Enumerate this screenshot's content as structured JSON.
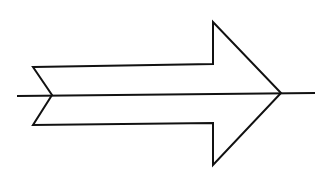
{
  "diagram": {
    "type": "arrow-with-axis",
    "background": "#ffffff",
    "stroke_color": "#111111",
    "stroke_width": 2,
    "arrow": {
      "shape": "block-arrow-right-notched-tail",
      "points": [
        [
          33,
          67
        ],
        [
          213,
          64
        ],
        [
          213,
          22
        ],
        [
          281,
          93
        ],
        [
          213,
          165
        ],
        [
          213,
          123
        ],
        [
          33,
          125
        ],
        [
          52,
          95
        ]
      ]
    },
    "axis_line": {
      "from": [
        17,
        96
      ],
      "to": [
        315,
        93
      ]
    }
  }
}
